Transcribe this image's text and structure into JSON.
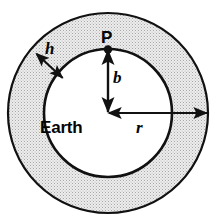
{
  "figure": {
    "background_color": "#ffffff",
    "stroke_color": "#111111",
    "shell_fill_color": "#e8e8e8",
    "shell_stipple_color": "#9a9a9a",
    "core_fill_color": "#ffffff"
  },
  "geometry": {
    "center": {
      "x": 108,
      "y": 113
    },
    "outer_radius": 100,
    "inner_radius": 64,
    "shell_thickness": 36
  },
  "labels": {
    "point_p": "P",
    "core": "Earth",
    "shell_thickness": "h",
    "inner_radius": "b",
    "outer_radius": "r"
  },
  "annotations": [
    {
      "name": "thickness-arrow",
      "label": "h",
      "style": "double-headed",
      "orientation": "diagonal",
      "spans": "inner circle to outer circle"
    },
    {
      "name": "inner-radius-arrow",
      "label": "b",
      "style": "double-headed",
      "orientation": "vertical",
      "spans": "center to point P on inner circle"
    },
    {
      "name": "outer-radius-arrow",
      "label": "r",
      "style": "double-headed",
      "orientation": "horizontal",
      "spans": "center to outer circle"
    }
  ],
  "markers": [
    {
      "name": "point-p-dot",
      "label": "P",
      "x": 108,
      "y": 49,
      "radius": 4
    }
  ]
}
